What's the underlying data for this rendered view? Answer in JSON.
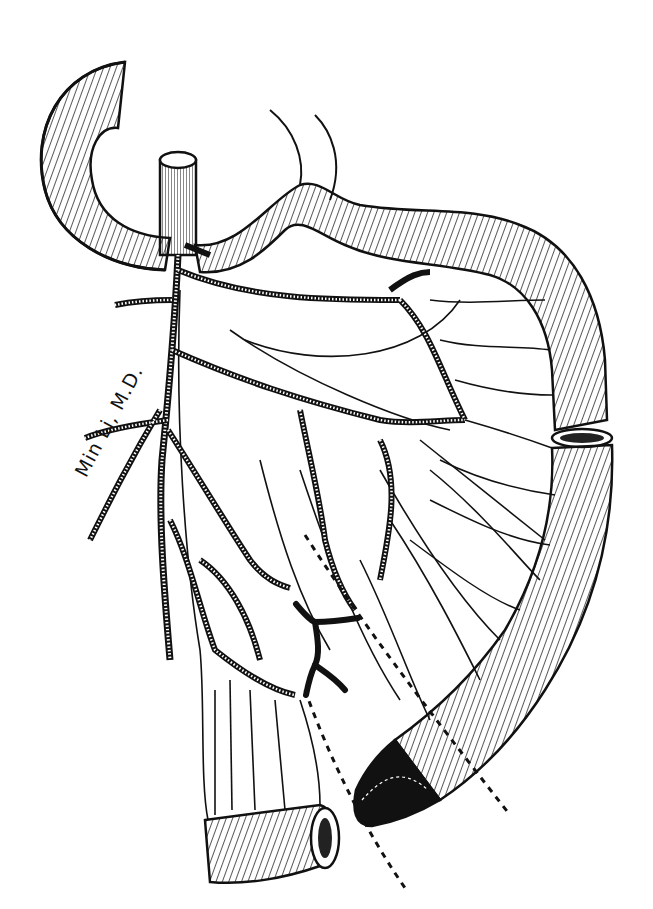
{
  "illustration": {
    "subject": "mesenteric vascular anatomy with bowel resection",
    "signature": "Min Li, M.D.",
    "colors": {
      "ink": "#111111",
      "paper": "#ffffff"
    },
    "elements": [
      "upper-left-bowel-loop",
      "upper-right-bowel-loop",
      "right-descending-bowel-segment",
      "cut-bowel-end-right",
      "shaded-bowel-segment",
      "lower-cut-bowel-end",
      "main-vascular-trunk",
      "vascular-arcades",
      "ligated-dark-vessel",
      "dashed-resection-lines"
    ]
  }
}
